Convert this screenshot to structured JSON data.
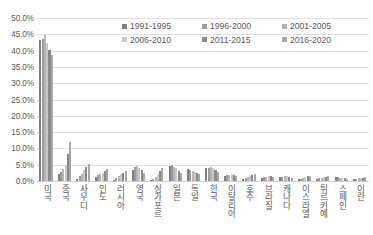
{
  "chart_data": {
    "type": "bar",
    "title": "",
    "xlabel": "",
    "ylabel": "",
    "ylim": [
      0,
      50
    ],
    "grid": true,
    "legend_position": "top-center",
    "y_ticks": [
      "0.0%",
      "5.0%",
      "10.0%",
      "15.0%",
      "20.0%",
      "25.0%",
      "30.0%",
      "35.0%",
      "40.0%",
      "45.0%",
      "50.0%"
    ],
    "y_tick_values": [
      0,
      5,
      10,
      15,
      20,
      25,
      30,
      35,
      40,
      45,
      50
    ],
    "categories": [
      "미국",
      "중국",
      "사우디",
      "인도",
      "러시아",
      "영국",
      "싱가포르",
      "일본",
      "독일",
      "한국",
      "이탈리아",
      "호주",
      "브라질",
      "캐나다",
      "이스라엘",
      "튀르키예",
      "스페인",
      "이란"
    ],
    "series": [
      {
        "name": "1991-1995",
        "color": "#808080",
        "values": [
          43.2,
          2.2,
          0.5,
          1.3,
          0.4,
          3.5,
          0.3,
          4.7,
          3.6,
          3.9,
          1.5,
          0.7,
          0.9,
          1.2,
          0.5,
          0.6,
          1.1,
          0.5
        ]
      },
      {
        "name": "1996-2000",
        "color": "#9c9c9c",
        "values": [
          43.6,
          2.8,
          1.4,
          1.8,
          1.0,
          4.2,
          0.6,
          5.0,
          3.3,
          4.1,
          1.7,
          1.0,
          1.1,
          1.3,
          0.7,
          0.9,
          1.2,
          0.6
        ]
      },
      {
        "name": "2001-2005",
        "color": "#b5b5b5",
        "values": [
          44.9,
          3.6,
          2.3,
          2.2,
          1.6,
          4.6,
          1.2,
          4.4,
          3.1,
          4.3,
          1.9,
          1.3,
          1.3,
          1.4,
          0.9,
          1.0,
          1.0,
          0.8
        ]
      },
      {
        "name": "2006-2010",
        "color": "#c9c9c9",
        "values": [
          42.4,
          5.0,
          3.4,
          2.6,
          2.1,
          4.1,
          2.0,
          3.9,
          2.9,
          4.0,
          2.0,
          1.6,
          1.5,
          1.5,
          1.1,
          1.2,
          0.9,
          0.9
        ]
      },
      {
        "name": "2011-2015",
        "color": "#8a8a8a",
        "values": [
          40.1,
          8.4,
          4.3,
          3.1,
          2.5,
          3.4,
          3.0,
          3.2,
          2.6,
          3.5,
          1.8,
          1.9,
          1.4,
          1.3,
          1.4,
          1.3,
          0.8,
          1.0
        ]
      },
      {
        "name": "2016-2020",
        "color": "#a8a8a8",
        "values": [
          38.8,
          12.1,
          5.3,
          3.7,
          3.0,
          2.6,
          3.9,
          2.5,
          2.2,
          2.8,
          1.4,
          2.1,
          1.2,
          1.0,
          1.6,
          1.5,
          0.7,
          1.1
        ]
      }
    ]
  }
}
